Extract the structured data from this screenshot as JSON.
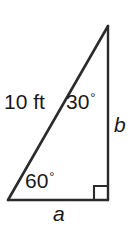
{
  "figure": {
    "type": "right-triangle-diagram",
    "canvas": {
      "width": 140,
      "height": 227,
      "background": "#ffffff"
    },
    "stroke_color": "#2b2b2b",
    "text_color": "#1a1a1a",
    "vertices": {
      "apex": {
        "x": 108,
        "y": 26
      },
      "bottom_right": {
        "x": 108,
        "y": 200
      },
      "bottom_left": {
        "x": 8,
        "y": 200
      }
    },
    "right_angle_marker": {
      "x": 94,
      "y": 186,
      "size": 14,
      "at_vertex": "bottom_right"
    },
    "labels": {
      "hypotenuse_length": "10 ft",
      "apex_angle_value": "30",
      "base_angle_value": "60",
      "degree_symbol": "°",
      "vertical_leg": "b",
      "horizontal_leg": "a"
    }
  }
}
